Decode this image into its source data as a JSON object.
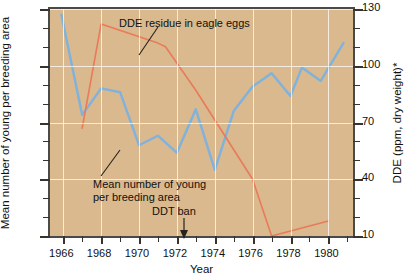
{
  "chart_data": {
    "type": "line",
    "title": "",
    "xlabel": "Year",
    "ylabel": "Mean number of young per breeding area",
    "ylabel_right": "DDE (ppm, dry weight)*",
    "xlim": [
      1965.3,
      1981.3
    ],
    "ylim": [
      0.1,
      1.3
    ],
    "ylim_right": [
      10,
      130
    ],
    "grid": true,
    "legend": "annotations-inline",
    "x_ticks": [
      1966,
      1968,
      1970,
      1972,
      1974,
      1976,
      1978,
      1980
    ],
    "x_tick_labels": [
      "1966",
      "1968",
      "1970",
      "1972",
      "1974",
      "1976",
      "1978",
      "1980"
    ],
    "x_minor_ticks": [
      1967,
      1969,
      1971,
      1973,
      1975,
      1977,
      1979
    ],
    "y_ticks_left": [
      0.1,
      0.4,
      0.7,
      1.0,
      1.3
    ],
    "y_tick_labels_left": [
      "0.1",
      "0.4",
      "0.7",
      "1.0",
      "1.3"
    ],
    "y_ticks_right": [
      10,
      40,
      70,
      100,
      130
    ],
    "y_tick_labels_right": [
      "10",
      "40",
      "70",
      "100",
      "130"
    ],
    "series": [
      {
        "name": "Mean number of young per breeding area",
        "axis": "left",
        "color": "#7fb2dd",
        "x": [
          1965.9,
          1967.0,
          1968.0,
          1969.0,
          1970.0,
          1971.0,
          1972.0,
          1973.0,
          1974.0,
          1975.0,
          1976.0,
          1977.0,
          1978.0,
          1978.6,
          1979.6,
          1980.8
        ],
        "values": [
          1.27,
          0.74,
          0.88,
          0.86,
          0.58,
          0.63,
          0.54,
          0.77,
          0.45,
          0.76,
          0.89,
          0.96,
          0.84,
          0.99,
          0.92,
          1.12
        ]
      },
      {
        "name": "DDE residue in eagle eggs",
        "axis": "right",
        "color": "#ea7a5a",
        "x": [
          1967.0,
          1968.0,
          1971.0,
          1971.4,
          1973.0,
          1976.0,
          1977.0,
          1980.0
        ],
        "values": [
          67,
          122,
          112,
          110,
          87,
          40,
          10,
          18
        ]
      }
    ],
    "annotations": [
      {
        "name": "dde-annotation",
        "text": "DDE residue in eagle eggs",
        "x": 1970.0,
        "y_right": 128
      },
      {
        "name": "mean-annotation",
        "text": "Mean number of young",
        "text2": "per breeding area",
        "x": 1968.8,
        "y_left": 0.4
      },
      {
        "name": "ddt-ban-annotation",
        "text": "DDT ban",
        "x": 1972.5,
        "marker": "down-arrow"
      }
    ]
  },
  "axes": {
    "left_title": "Mean number of young per breeding area",
    "right_title": "DDE (ppm, dry weight)*",
    "x_title": "Year"
  },
  "annotations": {
    "dde": "DDE residue in eagle eggs",
    "mean_line1": "Mean number of young",
    "mean_line2": "per breeding area",
    "ddt_ban": "DDT ban"
  },
  "colors": {
    "plot_background": "#d9b98d",
    "grid": "#ffffff",
    "frame": "#4a4a48",
    "series_blue": "#7fb2dd",
    "series_red": "#ea7a5a",
    "text": "#111111"
  }
}
